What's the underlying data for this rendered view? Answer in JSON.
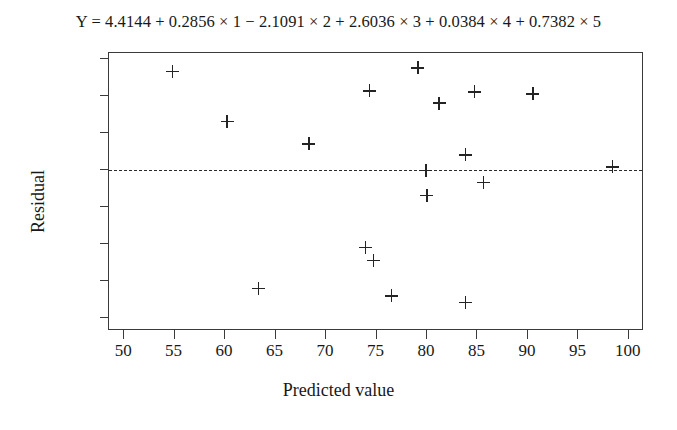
{
  "chart_data": {
    "type": "scatter",
    "title": "Y = 4.4144 + 0.2856 × 1 − 2.1091 × 2 + 2.6036 × 3 + 0.0384 × 4 + 0.7382 × 5",
    "xlabel": "Predicted value",
    "ylabel": "Residual",
    "xlim": [
      48.5,
      101.5
    ],
    "ylim": [
      -8.7,
      6.3
    ],
    "xticks": [
      50,
      55,
      60,
      65,
      70,
      75,
      80,
      85,
      90,
      95,
      100
    ],
    "yticks": [
      6,
      4,
      2,
      0,
      -2,
      -4,
      -6,
      -8
    ],
    "xtick_labels": [
      "50",
      "55",
      "60",
      "65",
      "70",
      "75",
      "80",
      "85",
      "90",
      "95",
      "100"
    ],
    "ytick_labels": [
      "6",
      "4",
      "2",
      "0",
      "−2",
      "−4",
      "−6",
      "−8"
    ],
    "grid": false,
    "legend": false,
    "marker": "plus",
    "reference_lines": [
      {
        "axis": "y",
        "value": 0,
        "style": "dashed"
      }
    ],
    "x": [
      54.8,
      60.2,
      63.3,
      68.3,
      73.9,
      74.3,
      74.7,
      76.5,
      79.1,
      79.9,
      80.0,
      81.2,
      83.8,
      83.8,
      84.7,
      85.6,
      90.5,
      98.4
    ],
    "y": [
      5.3,
      2.6,
      -6.4,
      1.4,
      -4.2,
      4.25,
      -4.9,
      -6.8,
      5.5,
      -0.05,
      -1.4,
      3.6,
      0.8,
      -7.15,
      4.2,
      -0.7,
      4.1,
      0.15
    ],
    "points": [
      {
        "x": 54.8,
        "y": 5.3
      },
      {
        "x": 60.2,
        "y": 2.6
      },
      {
        "x": 63.3,
        "y": -6.4
      },
      {
        "x": 68.3,
        "y": 1.4
      },
      {
        "x": 73.9,
        "y": -4.2
      },
      {
        "x": 74.3,
        "y": 4.25
      },
      {
        "x": 74.7,
        "y": -4.9
      },
      {
        "x": 76.5,
        "y": -6.8
      },
      {
        "x": 79.1,
        "y": 5.5
      },
      {
        "x": 79.9,
        "y": -0.05
      },
      {
        "x": 80.0,
        "y": -1.4
      },
      {
        "x": 81.2,
        "y": 3.6
      },
      {
        "x": 83.8,
        "y": 0.8
      },
      {
        "x": 83.8,
        "y": -7.15
      },
      {
        "x": 84.7,
        "y": 4.2
      },
      {
        "x": 85.6,
        "y": -0.7
      },
      {
        "x": 90.5,
        "y": 4.1
      },
      {
        "x": 98.4,
        "y": 0.15
      }
    ]
  }
}
